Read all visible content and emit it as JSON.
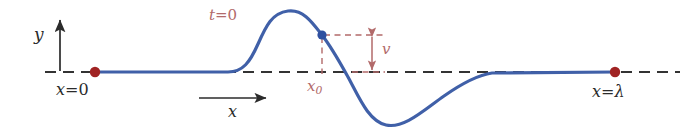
{
  "figure": {
    "kind": "wave-snapshot-diagram",
    "width": 692,
    "height": 137,
    "background": "#ffffff"
  },
  "colors": {
    "wave": "#4060a8",
    "axis": "#333333",
    "endpoint_dot": "#a02323",
    "marker_dot": "#3050a0",
    "annotation": "#b26a6a",
    "text": "#2b2b2b"
  },
  "labels": {
    "y_axis": "y",
    "x_axis": "x",
    "x_origin": "x",
    "x_origin_op": "=",
    "x_origin_value": "0",
    "x_end": "x",
    "x_end_op": "=",
    "x_end_value": "λ",
    "time": "t",
    "time_op": "=",
    "time_value": "0",
    "x_marker": "x",
    "x_marker_sub": "0",
    "velocity": "v"
  },
  "chart_data": {
    "type": "line",
    "title": "",
    "xlabel": "x",
    "ylabel": "y",
    "annotations": [
      {
        "name": "t=0",
        "text": "t = 0",
        "x_px": 209,
        "y_px": 8,
        "color": "#b26a6a"
      },
      {
        "name": "x0",
        "text": "x₀",
        "x_px": 307,
        "y_px": 79,
        "color": "#b26a6a"
      },
      {
        "name": "v",
        "text": "v",
        "x_px": 382,
        "y_px": 42,
        "color": "#b26a6a"
      },
      {
        "name": "x=0",
        "text": "x = 0",
        "x_px": 56,
        "y_px": 82,
        "color": "#2b2b2b"
      },
      {
        "name": "x=lambda",
        "text": "x = λ",
        "x_px": 592,
        "y_px": 84,
        "color": "#2b2b2b"
      }
    ],
    "axis_y_px": 72,
    "axis_x_range_px": [
      45,
      680
    ],
    "markers": [
      {
        "name": "origin-endpoint",
        "x_px": 95,
        "y_px": 72,
        "color": "#a02323",
        "radius": 5
      },
      {
        "name": "lambda-endpoint",
        "x_px": 615,
        "y_px": 72,
        "color": "#a02323",
        "radius": 5
      },
      {
        "name": "wave-point",
        "x_px": 322,
        "y_px": 35,
        "color": "#3050a0",
        "radius": 4.5
      }
    ],
    "wave_path_px": "M 95,72 L 228,72 C 243,72 250,62 258,44 C 266,26 272,13 288,11 C 303,9 312,22 322,35 C 332,48 338,59 348,77 C 358,95 368,121 386,125 C 404,129 424,110 444,96 C 464,82 478,75 492,73 L 615,72",
    "grid": false,
    "legend": null
  }
}
